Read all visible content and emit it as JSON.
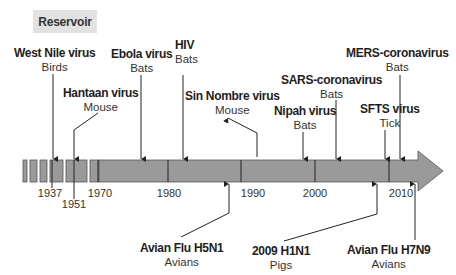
{
  "legend": {
    "label": "Reservoir"
  },
  "colors": {
    "bar_fill": "#9a9a9a",
    "bar_stroke": "#555555",
    "line": "#222222",
    "legend_bg": "#e2e2e2"
  },
  "years": [
    "1937",
    "1951",
    "1970",
    "1980",
    "1990",
    "2000",
    "2010"
  ],
  "events_above": [
    {
      "name": "West Nile virus",
      "host": "Birds"
    },
    {
      "name": "Hantaan virus",
      "host": "Mouse"
    },
    {
      "name": "Ebola virus",
      "host": "Bats"
    },
    {
      "name": "HIV",
      "host": "Bats"
    },
    {
      "name": "Sin Nombre virus",
      "host": "Mouse"
    },
    {
      "name": "Nipah virus",
      "host": "Bats"
    },
    {
      "name": "SARS-coronavirus",
      "host": "Bats"
    },
    {
      "name": "SFTS virus",
      "host": "Tick"
    },
    {
      "name": "MERS-coronavirus",
      "host": "Bats"
    }
  ],
  "events_below": [
    {
      "name": "Avian Flu H5N1",
      "host": "Avians"
    },
    {
      "name": "2009 H1N1",
      "host": "Pigs"
    },
    {
      "name": "Avian Flu H7N9",
      "host": "Avians"
    }
  ]
}
